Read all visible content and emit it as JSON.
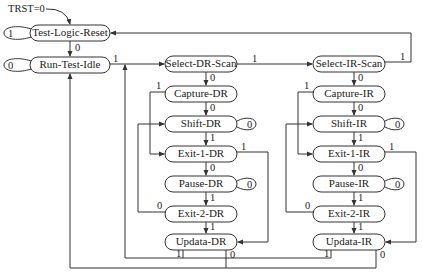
{
  "diagram": {
    "reset_label": "TRST=0",
    "states": {
      "tlr": "Test-Logic-Reset",
      "rti": "Run-Test-Idle",
      "sdr": "Select-DR-Scan",
      "cdr": "Capture-DR",
      "shdr": "Shift-DR",
      "e1dr": "Exit-1-DR",
      "pdr": "Pause-DR",
      "e2dr": "Exit-2-DR",
      "udr": "Updata-DR",
      "sir": "Select-IR-Scan",
      "cir": "Capture-IR",
      "shir": "Shift-IR",
      "e1ir": "Exit-1-IR",
      "pir": "Pause-IR",
      "e2ir": "Exit-2-IR",
      "uir": "Updata-IR"
    },
    "edge_labels": {
      "zero": "0",
      "one": "1"
    },
    "colors": {
      "stroke": "#333333",
      "text": "#222222",
      "background": "#ffffff"
    }
  }
}
